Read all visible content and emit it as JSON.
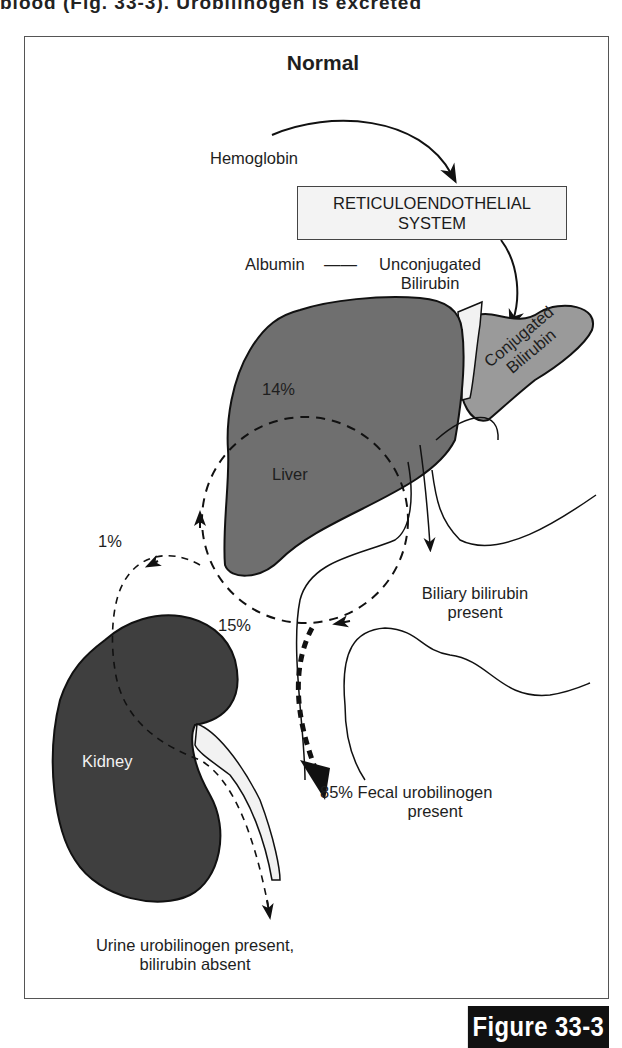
{
  "page": {
    "top_partial_text": "blood (Fig. 33-3). Urobilinogen is excreted"
  },
  "diagram": {
    "title": "Normal",
    "labels": {
      "hemoglobin": "Hemoglobin",
      "res_line1": "RETICULOENDOTHELIAL",
      "res_line2": "SYSTEM",
      "albumin": "Albumin",
      "connector": "——",
      "unconjugated_line1": "Unconjugated",
      "unconjugated_line2": "Bilirubin",
      "conjugated_line1": "Conjugated",
      "conjugated_line2": "Bilirubin",
      "liver": "Liver",
      "kidney": "Kidney",
      "pct_14": "14%",
      "pct_1": "1%",
      "pct_15": "15%",
      "biliary_line1": "Biliary bilirubin",
      "biliary_line2": "present",
      "fecal_line1": "85% Fecal urobilinogen",
      "fecal_line2": "present",
      "urine_line1": "Urine urobilinogen present,",
      "urine_line2": "bilirubin absent"
    },
    "colors": {
      "liver_fill": "#6f6f6f",
      "gallbladder_fill": "#9a9a9a",
      "kidney_fill": "#3f3f3f",
      "ureter_fill": "#f2f2f2",
      "outline": "#111111"
    }
  },
  "caption": {
    "figure_label": "Figure 33-3"
  }
}
